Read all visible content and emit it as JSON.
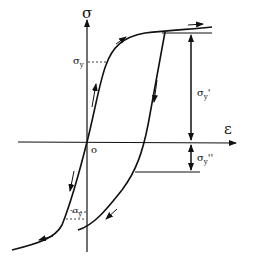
{
  "diagram": {
    "type": "stress-strain hysteresis (Bauschinger effect)",
    "axes": {
      "y_label": "σ",
      "x_label": "ε",
      "origin_label": "o"
    },
    "annotations": {
      "yield_stress": "σ",
      "yield_stress_sub": "y",
      "reverse_yield": "-σ",
      "reverse_yield_sub": "y",
      "span_upper": "σ",
      "span_upper_sub": "y",
      "span_upper_prime": "'",
      "span_lower": "σ",
      "span_lower_sub": "y",
      "span_lower_prime": "''"
    },
    "colors": {
      "line": "#111111",
      "background": "#ffffff"
    }
  }
}
